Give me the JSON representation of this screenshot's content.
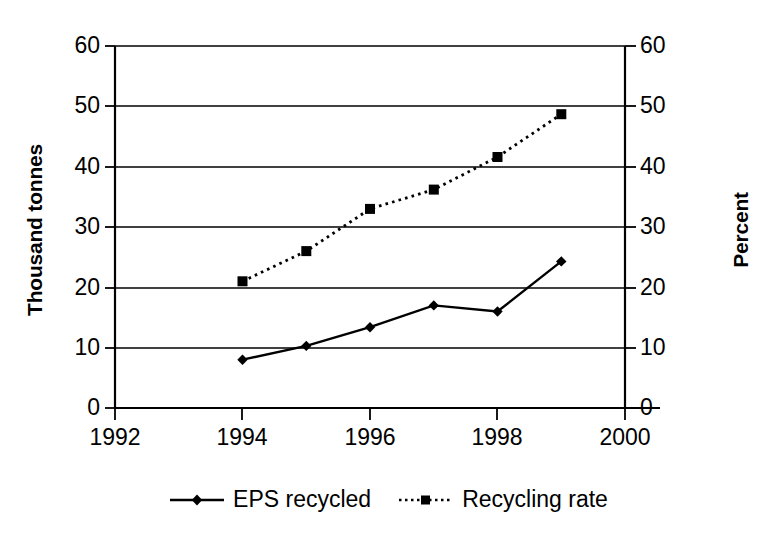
{
  "chart_data": {
    "type": "line",
    "title": "",
    "xlabel": "",
    "ylabel": "Thousand tonnes",
    "y2label": "Percent",
    "xlim": [
      1992,
      2000
    ],
    "ylim": [
      0,
      60
    ],
    "y2lim": [
      0,
      60
    ],
    "grid": "horizontal",
    "legend_position": "bottom",
    "x_ticks": [
      "1992",
      "1994",
      "1996",
      "1998",
      "2000"
    ],
    "y_ticks": [
      "0",
      "10",
      "20",
      "30",
      "40",
      "50",
      "60"
    ],
    "y2_ticks": [
      "0",
      "10",
      "20",
      "30",
      "40",
      "50",
      "60"
    ],
    "x": [
      1994,
      1995,
      1996,
      1997,
      1998,
      1999
    ],
    "series": [
      {
        "name": "EPS recycled",
        "axis": "left",
        "unit": "Thousand tonnes",
        "marker": "diamond",
        "line_style": "solid",
        "color": "#000000",
        "values": [
          8.0,
          10.3,
          13.4,
          17.0,
          16.0,
          24.3
        ]
      },
      {
        "name": "Recycling rate",
        "axis": "right",
        "unit": "Percent",
        "marker": "square",
        "line_style": "dotted",
        "color": "#000000",
        "values": [
          21.0,
          26.0,
          33.0,
          36.2,
          41.6,
          48.7
        ]
      }
    ]
  },
  "legend": {
    "items": [
      {
        "label": "EPS recycled"
      },
      {
        "label": "Recycling rate"
      }
    ]
  }
}
